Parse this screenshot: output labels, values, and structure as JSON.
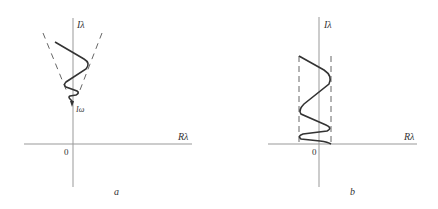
{
  "panels": [
    {
      "id": "a",
      "caption": "a",
      "axis_labels": {
        "imag": "Iλ",
        "real": "Rλ",
        "origin": "0"
      },
      "annotation": "Iω",
      "description": "Oscillating curve confined between diverging dashed lines, spiraling down toward the point iω on the imaginary axis"
    },
    {
      "id": "b",
      "caption": "b",
      "axis_labels": {
        "imag": "Iλ",
        "real": "Rλ",
        "origin": "0"
      },
      "description": "Oscillating curve confined between two parallel vertical dashed lines, decaying toward the real axis"
    }
  ],
  "colors": {
    "axis": "#888888",
    "curve": "#333333",
    "dashed": "#666666",
    "text": "#333333"
  }
}
